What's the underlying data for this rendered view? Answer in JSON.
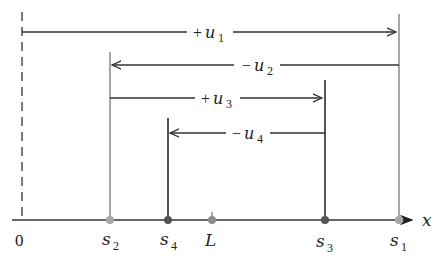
{
  "diagram": {
    "axis": {
      "label": "x",
      "color": "#333333"
    },
    "origin": {
      "label": "0"
    },
    "points": [
      {
        "id": "s2",
        "base": "s",
        "sub": "2",
        "x": 110,
        "color": "#a6a6a6",
        "line_top": 52
      },
      {
        "id": "s4",
        "base": "s",
        "sub": "4",
        "x": 168,
        "color": "#555555",
        "line_top": 118
      },
      {
        "id": "L",
        "base": "L",
        "sub": "",
        "x": 212,
        "color": "#8c8c8c",
        "line_top": 212
      },
      {
        "id": "s3",
        "base": "s",
        "sub": "3",
        "x": 325,
        "color": "#555555",
        "line_top": 80
      },
      {
        "id": "s1",
        "base": "s",
        "sub": "1",
        "x": 399,
        "color": "#a6a6a6",
        "line_top": 14
      }
    ],
    "displacements": [
      {
        "id": "u1",
        "sign": "+",
        "base": "u",
        "sub": "1",
        "from": 22,
        "to": 397,
        "y": 32,
        "direction": "right"
      },
      {
        "id": "u2",
        "sign": "−",
        "base": "u",
        "sub": "2",
        "from": 399,
        "to": 112,
        "y": 65,
        "direction": "left"
      },
      {
        "id": "u3",
        "sign": "+",
        "base": "u",
        "sub": "3",
        "from": 110,
        "to": 323,
        "y": 98,
        "direction": "right"
      },
      {
        "id": "u4",
        "sign": "−",
        "base": "u",
        "sub": "4",
        "from": 325,
        "to": 170,
        "y": 133,
        "direction": "left"
      }
    ],
    "labels": {
      "u1_sign": "+",
      "u1_base": "u",
      "u1_sub": "1",
      "u2_sign": "−",
      "u2_base": "u",
      "u2_sub": "2",
      "u3_sign": "+",
      "u3_base": "u",
      "u3_sub": "3",
      "u4_sign": "−",
      "u4_base": "u",
      "u4_sub": "4",
      "s1_base": "s",
      "s1_sub": "1",
      "s2_base": "s",
      "s2_sub": "2",
      "s3_base": "s",
      "s3_sub": "3",
      "s4_base": "s",
      "s4_sub": "4",
      "L": "L",
      "origin": "0",
      "x_axis": "x"
    }
  }
}
